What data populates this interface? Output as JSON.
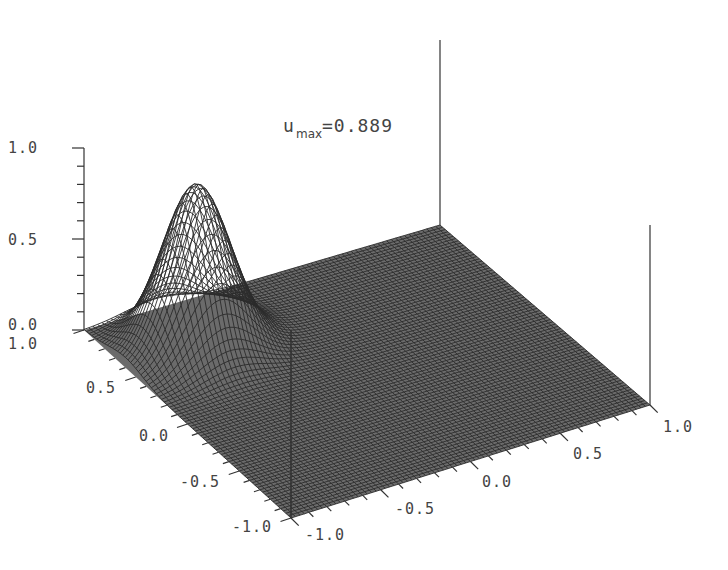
{
  "chart_data": {
    "type": "surface3d",
    "annotation": {
      "symbol": "u",
      "subscript": "max",
      "value": "0.889"
    },
    "z_axis": {
      "ticks": [
        "0.0",
        "0.5",
        "1.0"
      ],
      "range": [
        0.0,
        1.0
      ]
    },
    "x_axis": {
      "ticks": [
        "-1.0",
        "-0.5",
        "0.0",
        "0.5",
        "1.0"
      ],
      "range": [
        -1.0,
        1.0
      ]
    },
    "y_axis": {
      "ticks": [
        "-1.0",
        "-0.5",
        "0.0",
        "0.5",
        "1.0"
      ],
      "range": [
        -1.0,
        1.0
      ]
    },
    "surface": {
      "description": "Wireframe mesh on [-1,1]x[-1,1], nearly flat (0) except a single Gaussian-like bump",
      "peak_value": 0.889,
      "peak_location_approx": {
        "x": -0.5,
        "y": 0.5
      },
      "grid_resolution_approx": 81
    }
  },
  "labels": {
    "z": [
      "1.0",
      "0.5",
      "0.0"
    ],
    "left_axis": [
      "1.0",
      "0.5",
      "0.0",
      "-0.5",
      "-1.0"
    ],
    "right_axis": [
      "-1.0",
      "-0.5",
      "0.0",
      "0.5",
      "1.0"
    ],
    "title_u": "u",
    "title_sub": "max",
    "title_val": "=0.889"
  }
}
